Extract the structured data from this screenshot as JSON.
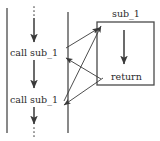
{
  "diagram": {
    "type": "control-flow-diagram",
    "colors": {
      "stroke": "#3a3a3a",
      "text": "#2b2b2b",
      "background": "#ffffff"
    },
    "labels": {
      "call_1": "call sub_1",
      "call_2": "call sub_1",
      "subroutine_name": "sub_1",
      "return": "return"
    },
    "elements": {
      "left_boundary_line": "vertical line",
      "mid_boundary_line": "vertical line",
      "main_flow_line": "vertical arrow chain with ellipsis at top and bottom",
      "subroutine_box": "rectangle containing sub_1 body",
      "subroutine_flow_arrow": "downward arrow inside box",
      "call_arrow_1": "diagonal arrow from first call to subroutine entry",
      "call_arrow_2": "diagonal arrow from second call to subroutine entry",
      "return_arrow_1": "diagonal arrow from return back to first caller",
      "return_arrow_2": "diagonal arrow from return back to second caller",
      "ellipsis_top": "vertical dots",
      "ellipsis_bottom": "vertical dots"
    }
  }
}
